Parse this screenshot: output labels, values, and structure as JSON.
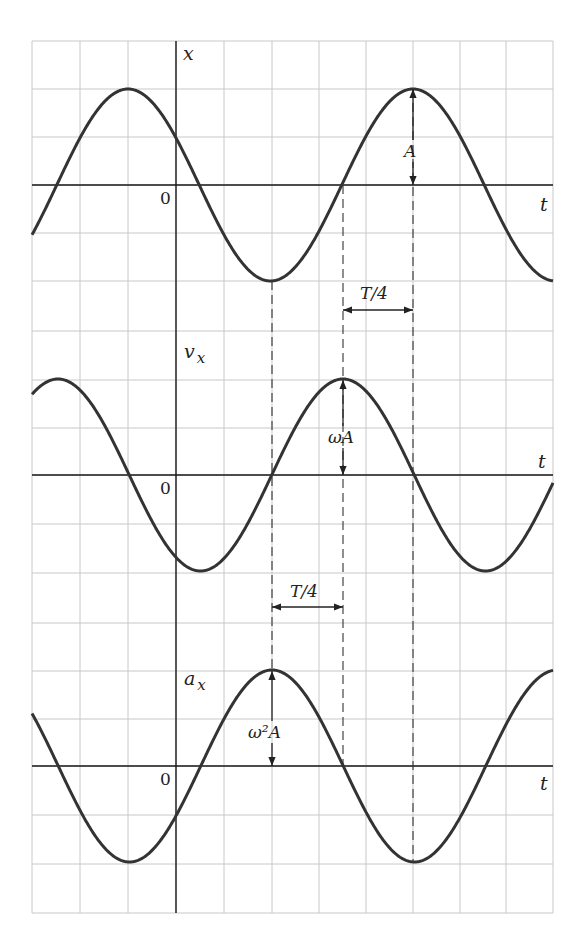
{
  "figure": {
    "grid": {
      "columns_px": [
        32,
        80,
        128,
        176,
        224,
        272,
        319,
        366,
        413,
        460,
        506,
        553
      ],
      "rows_px": [
        41,
        89,
        137,
        185,
        233,
        281,
        331,
        380,
        428,
        475,
        524,
        573,
        623,
        671,
        719,
        766,
        815,
        864,
        913
      ],
      "color": "#c8c8c8"
    },
    "axis_color": "#1a1a1a",
    "curve_color": "#333333",
    "period_px": 285,
    "amplitude_px": 96,
    "graphs": [
      {
        "id": "position",
        "ylabel": "x",
        "ysub": "",
        "origin": "0",
        "tlabel": "t",
        "axis_y": 185,
        "peak_x": 413,
        "annotation": {
          "label": "A",
          "x": 413
        }
      },
      {
        "id": "velocity",
        "ylabel": "v",
        "ysub": "x",
        "origin": "0",
        "tlabel": "t",
        "axis_y": 475,
        "peak_x": 343,
        "annotation": {
          "label": "ωA",
          "x": 343
        }
      },
      {
        "id": "acceleration",
        "ylabel": "a",
        "ysub": "x",
        "origin": "0",
        "tlabel": "t",
        "axis_y": 766,
        "peak_x": 272,
        "annotation": {
          "label": "ω²A",
          "x": 272
        }
      }
    ],
    "quarter_period_marks": [
      {
        "label": "T/4",
        "from_x": 343,
        "to_x": 413,
        "y": 310
      },
      {
        "label": "T/4",
        "from_x": 272,
        "to_x": 343,
        "y": 607
      }
    ],
    "dashed_guides": [
      {
        "x": 272,
        "y1": 281,
        "y2": 671
      },
      {
        "x": 343,
        "y1": 185,
        "y2": 766
      },
      {
        "x": 413,
        "y1": 89,
        "y2": 862
      }
    ]
  }
}
